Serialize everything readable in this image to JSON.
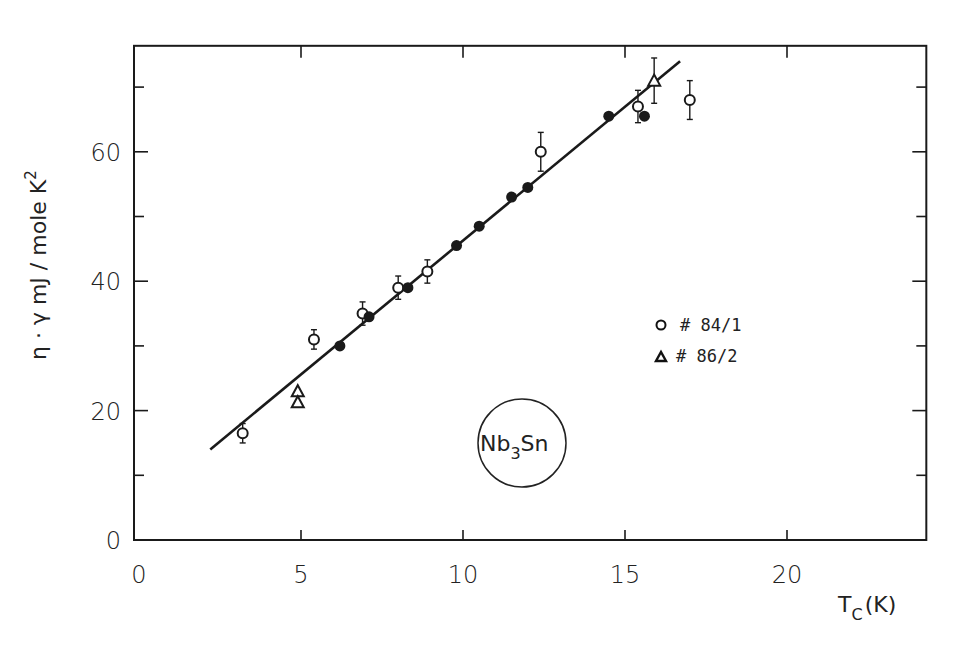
{
  "chart_data": {
    "type": "scatter",
    "title": "",
    "xlabel": "T_C (K)",
    "ylabel": "η · γ  mJ / mole K²",
    "xlim": [
      0,
      24.3
    ],
    "ylim": [
      0,
      77
    ],
    "x_ticks": [
      0,
      5,
      10,
      15,
      20
    ],
    "x_tick_labels": [
      "0",
      "5",
      "10",
      "15",
      "20"
    ],
    "y_ticks": [
      0,
      20,
      40,
      60
    ],
    "y_tick_labels": [
      "0",
      "20",
      "40",
      "60"
    ],
    "y_minor_ticks": [
      10,
      30,
      50,
      70
    ],
    "grid": false,
    "annotation": "Nb3Sn",
    "legend_position": "right-middle",
    "series": [
      {
        "name": "# 84/1",
        "marker": "open-circle",
        "points": [
          {
            "x": 3.2,
            "y": 16.5,
            "err": 1.5
          },
          {
            "x": 5.4,
            "y": 31.0,
            "err": 1.5
          },
          {
            "x": 6.9,
            "y": 35.0,
            "err": 1.8
          },
          {
            "x": 8.0,
            "y": 39.0,
            "err": 1.8
          },
          {
            "x": 8.9,
            "y": 41.5,
            "err": 1.8
          },
          {
            "x": 12.4,
            "y": 60.0,
            "err": 3.0
          },
          {
            "x": 15.4,
            "y": 67.0,
            "err": 2.5
          },
          {
            "x": 17.0,
            "y": 68.0,
            "err": 3.0
          }
        ]
      },
      {
        "name": "# 86/2",
        "marker": "open-triangle",
        "points": [
          {
            "x": 4.9,
            "y": 23.0,
            "err": 0
          },
          {
            "x": 4.9,
            "y": 21.3,
            "err": 0
          },
          {
            "x": 15.9,
            "y": 71.0,
            "err": 3.5
          }
        ]
      },
      {
        "name": "unlabeled (filled)",
        "marker": "filled-circle",
        "points": [
          {
            "x": 6.2,
            "y": 30.0
          },
          {
            "x": 7.1,
            "y": 34.5
          },
          {
            "x": 8.3,
            "y": 39.0
          },
          {
            "x": 9.8,
            "y": 45.5
          },
          {
            "x": 10.5,
            "y": 48.5
          },
          {
            "x": 11.5,
            "y": 53.0
          },
          {
            "x": 12.0,
            "y": 54.5
          },
          {
            "x": 14.5,
            "y": 65.5
          },
          {
            "x": 15.6,
            "y": 65.5
          }
        ]
      }
    ],
    "fit_line": {
      "x": [
        2.2,
        16.7
      ],
      "y": [
        14.0,
        74.0
      ]
    }
  },
  "labels": {
    "y_axis": "η · γ  mJ / mole K",
    "y_axis_sup": "2",
    "x_axis_main": "T",
    "x_axis_sub": "C",
    "x_axis_unit": "(K)",
    "legend_1": "# 84/1",
    "legend_2": "# 86/2",
    "material_main": "Nb",
    "material_sub": "3",
    "material_end": "Sn"
  }
}
